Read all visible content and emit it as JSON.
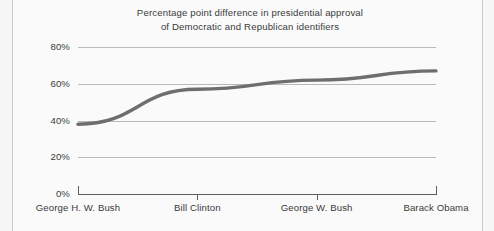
{
  "chart_data": {
    "type": "line",
    "title": "Percentage point difference in presidential approval of Democratic and Republican identifiers",
    "title_lines": [
      "Percentage point difference in presidential approval",
      "of Democratic and Republican identifiers"
    ],
    "xlabel": "",
    "ylabel": "",
    "categories": [
      "George H. W. Bush",
      "Bill Clinton",
      "George W. Bush",
      "Barack Obama"
    ],
    "values": [
      38,
      57,
      62,
      67
    ],
    "value_labels": [
      "38%",
      "57%",
      "62%",
      "67%"
    ],
    "ylim": [
      0,
      80
    ],
    "yticks": [
      0,
      20,
      40,
      60,
      80
    ],
    "ytick_labels": [
      "0%",
      "20%",
      "40%",
      "60%",
      "80%"
    ],
    "grid": true,
    "grid_axis": "y",
    "legend": false,
    "legend_position": "none",
    "series": [
      {
        "name": "Percentage point difference in presidential approval",
        "values": [
          38,
          57,
          62,
          67
        ],
        "color": "#6e6e6e",
        "line_width": 3.4,
        "marker": "none"
      }
    ],
    "colors": {
      "line": "#6e6e6e",
      "grid": "#b9b9b9",
      "axis": "#5d5d5d",
      "text": "#3b3b3b",
      "background": "#fafafa",
      "page_edge": "#c9c9c9"
    }
  }
}
